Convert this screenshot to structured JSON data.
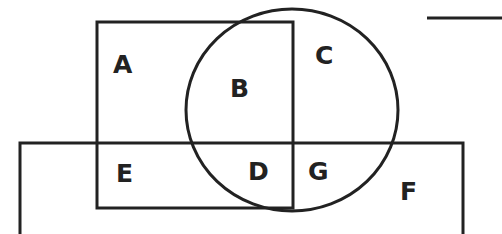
{
  "diagram": {
    "type": "venn-region-diagram",
    "stroke_color": "#222222",
    "background": "#ffffff",
    "shapes": {
      "upper_rectangle": {
        "x": 97,
        "y": 22,
        "width": 196,
        "height": 186
      },
      "lower_rectangle": {
        "x": 20,
        "y": 143,
        "width": 443,
        "height": 100
      },
      "circle": {
        "cx": 292,
        "cy": 110,
        "r": 103
      },
      "top_right_line": {
        "x1": 427,
        "y1": 18,
        "x2": 502,
        "y2": 18
      }
    },
    "regions": [
      {
        "label": "A",
        "x": 113,
        "y": 73
      },
      {
        "label": "B",
        "x": 230,
        "y": 97
      },
      {
        "label": "C",
        "x": 316,
        "y": 64
      },
      {
        "label": "E",
        "x": 116,
        "y": 182
      },
      {
        "label": "D",
        "x": 248,
        "y": 180
      },
      {
        "label": "G",
        "x": 308,
        "y": 180
      },
      {
        "label": "F",
        "x": 400,
        "y": 200
      }
    ]
  }
}
